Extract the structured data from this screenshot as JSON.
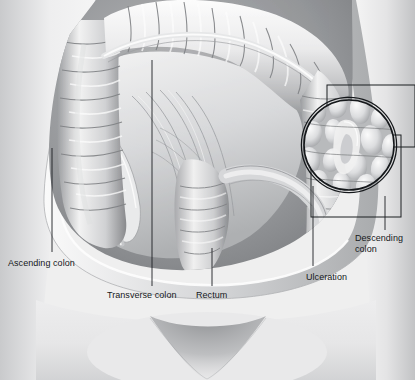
{
  "illustration": {
    "title": "Anatomical illustration of the abdomen with exposed large intestine showing ulceration",
    "subject": "abdomen-colon-cutaway",
    "style": "grayscale-medical-illustration",
    "width": 415,
    "height": 380
  },
  "palette": {
    "skin_light": "#f3f3f3",
    "skin_mid": "#d9d9da",
    "skin_shadow": "#b4b5b7",
    "cavity_dark": "#6e7073",
    "bowel_light": "#f2f2f2",
    "bowel_mid": "#c6c7c9",
    "bowel_shadow": "#8b8d90",
    "line": "#1b1e21",
    "label_text": "#15181b"
  },
  "labels": [
    {
      "id": "ascending-colon",
      "text": "Ascending colon",
      "x": 8,
      "y": 258,
      "align": "left",
      "leader": {
        "x1": 52,
        "y1": 148,
        "x2": 52,
        "y2": 252
      }
    },
    {
      "id": "transverse-colon",
      "text": "Transverse colon",
      "x": 107,
      "y": 290,
      "align": "left",
      "leader": {
        "x1": 152,
        "y1": 60,
        "x2": 152,
        "y2": 286
      }
    },
    {
      "id": "rectum",
      "text": "Rectum",
      "x": 196,
      "y": 290,
      "align": "left",
      "leader": {
        "x1": 212,
        "y1": 248,
        "x2": 212,
        "y2": 286
      }
    },
    {
      "id": "ulceration",
      "text": "Ulceration",
      "x": 306,
      "y": 272,
      "align": "left",
      "leader": {
        "x1": 313,
        "y1": 186,
        "x2": 313,
        "y2": 266
      }
    },
    {
      "id": "descending-colon",
      "text": "Descending\ncolon",
      "x": 355,
      "y": 233,
      "align": "left",
      "leader": {
        "x1": 385,
        "y1": 196,
        "x2": 385,
        "y2": 230
      }
    }
  ],
  "inset": {
    "id": "magnified-ulceration-inset",
    "shape": "double-ring-circle",
    "center_x": 349,
    "center_y": 145,
    "radius": 47,
    "content": "magnified ulcerated colonic mucosa",
    "callout_boxes": [
      {
        "id": "callout-box-upper",
        "x": 327,
        "y": 85,
        "w": 88,
        "h": 62
      },
      {
        "id": "callout-box-lower",
        "x": 311,
        "y": 135,
        "w": 90,
        "h": 82
      }
    ]
  },
  "structures": [
    {
      "id": "abdominal-wall",
      "name": "abdominal wall cut edge"
    },
    {
      "id": "ascending-colon",
      "name": "ascending colon"
    },
    {
      "id": "transverse-colon",
      "name": "transverse colon"
    },
    {
      "id": "descending-colon",
      "name": "descending colon"
    },
    {
      "id": "small-intestine",
      "name": "small intestine / mesentery"
    },
    {
      "id": "rectum",
      "name": "rectum"
    },
    {
      "id": "pubic-region",
      "name": "pubic region"
    }
  ]
}
